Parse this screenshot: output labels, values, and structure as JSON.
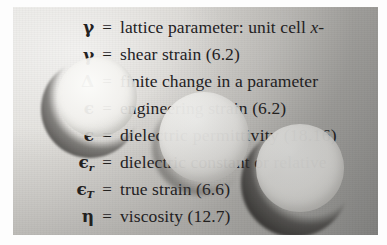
{
  "document": {
    "kind": "scanned-book-page",
    "section": "list-of-symbols",
    "paper_color": "#d9d7d3",
    "ink_color": "#23211f",
    "page_margin_color": "#fdfdfd"
  },
  "glossary": {
    "entries": [
      {
        "symbol": "γ",
        "subscript": "",
        "equals": "=",
        "definition": "lattice parameter: unit cell ",
        "definition_italic": "x-",
        "definition_tail": "",
        "truncated": true
      },
      {
        "symbol": "γ",
        "subscript": "",
        "equals": "=",
        "definition": "shear strain (6.2)",
        "definition_italic": "",
        "definition_tail": "",
        "truncated": false
      },
      {
        "symbol": "Δ",
        "subscript": "",
        "equals": "=",
        "definition": "finite change in a parameter",
        "definition_italic": "",
        "definition_tail": "",
        "truncated": false
      },
      {
        "symbol": "ϵ",
        "subscript": "",
        "equals": "=",
        "definition": "engineering strain (6.2)",
        "definition_italic": "",
        "definition_tail": "",
        "truncated": false
      },
      {
        "symbol": "ϵ",
        "subscript": "",
        "equals": "=",
        "definition": "dielectric permittivity (18.16)",
        "definition_italic": "",
        "definition_tail": "",
        "truncated": false
      },
      {
        "symbol": "ϵ",
        "subscript": "r",
        "equals": "=",
        "definition": "dielectric constant or relative",
        "definition_italic": "",
        "definition_tail": "",
        "truncated": true
      },
      {
        "symbol": "ϵ",
        "subscript": "T",
        "equals": "=",
        "definition": "true strain (6.6)",
        "definition_italic": "",
        "definition_tail": "",
        "truncated": false
      },
      {
        "symbol": "η",
        "subscript": "",
        "equals": "=",
        "definition": "viscosity (12.7)",
        "definition_italic": "",
        "definition_tail": "",
        "truncated": false
      }
    ]
  },
  "artifacts": {
    "blobs": [
      {
        "name": "lens-bubble-left",
        "shape": "circle-with-crescent-shadow"
      },
      {
        "name": "lens-bubble-center",
        "shape": "soft-opaque-disc"
      },
      {
        "name": "lens-bubble-right",
        "shape": "circle-with-crescent-shadow"
      }
    ]
  }
}
